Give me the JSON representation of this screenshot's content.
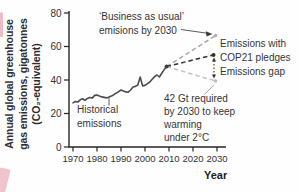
{
  "page": {
    "background": "#ffffff",
    "text_color": "#353535"
  },
  "labels": {
    "y_axis_title": "Annual global greenhouse\ngas emissions, gigatonnes\n(CO₂-equivalent)",
    "x_axis_title": "Year",
    "historical": "Historical\nemissions",
    "business_as_usual": "‘Business as usual’\nemisions by 2030",
    "cop21": "Emissions with\nCOP21 pledges",
    "emissions_gap": "Emissions gap",
    "required": "42 Gt required\nby 2030 to keep\nwarming\nunder 2°C"
  },
  "chart_data": {
    "type": "line",
    "title": "",
    "xlabel": "Year",
    "ylabel": "Annual global greenhouse gas emissions, gigatonnes (CO₂-equivalent)",
    "xlim": [
      1970,
      2033
    ],
    "ylim": [
      0,
      80
    ],
    "x_ticks": [
      1970,
      1980,
      1990,
      2000,
      2010,
      2020,
      2030
    ],
    "y_ticks": [
      0,
      20,
      40,
      60,
      80
    ],
    "grid": false,
    "legend_position": "none",
    "series": [
      {
        "name": "Historical emissions",
        "style": "solid",
        "color": "#4d4d4d",
        "x": [
          1970,
          1971,
          1972,
          1973,
          1974,
          1975,
          1976,
          1977,
          1978,
          1979,
          1980,
          1981,
          1982,
          1983,
          1984,
          1985,
          1986,
          1987,
          1988,
          1989,
          1990,
          1991,
          1992,
          1993,
          1994,
          1995,
          1996,
          1997,
          1998,
          1999,
          2000,
          2001,
          2002,
          2003,
          2004,
          2005,
          2006,
          2007,
          2008,
          2009
        ],
        "y": [
          26.3,
          27.2,
          26.8,
          28.2,
          28.8,
          27.9,
          29.0,
          29.6,
          29.2,
          30.8,
          31.0,
          30.4,
          29.9,
          29.6,
          29.3,
          29.8,
          30.4,
          31.2,
          32.2,
          33.0,
          34.0,
          33.5,
          32.9,
          32.7,
          34.0,
          35.8,
          36.2,
          37.0,
          41.8,
          36.5,
          36.8,
          37.8,
          38.8,
          40.5,
          42.0,
          43.0,
          41.8,
          44.0,
          46.2,
          48.0
        ]
      },
      {
        "name": "‘Business as usual’ emisions by 2030",
        "style": "dashed",
        "color": "#a8a8a8",
        "x": [
          2009,
          2030
        ],
        "y": [
          48,
          66.5
        ]
      },
      {
        "name": "Emissions with COP21 pledges",
        "style": "dashed",
        "color": "#333333",
        "x": [
          2009,
          2030
        ],
        "y": [
          48,
          55
        ]
      },
      {
        "name": "42 Gt required by 2030 to keep warming under 2°C",
        "style": "dashed",
        "color": "#c4c4c4",
        "x": [
          2009,
          2030
        ],
        "y": [
          48,
          42
        ]
      }
    ],
    "annotations": [
      {
        "text": "‘Business as usual’ emisions by 2030",
        "points_to_x": 2030,
        "points_to_y": 66.5
      },
      {
        "text": "Emissions with COP21 pledges",
        "points_to_x": 2030,
        "points_to_y": 55
      },
      {
        "text": "Emissions gap",
        "meaning": "gap between COP21 pledges and 42 Gt pathway at 2030"
      },
      {
        "text": "42 Gt required by 2030 to keep warming under 2°C",
        "points_to_x": 2030,
        "points_to_y": 42
      },
      {
        "text": "Historical emissions",
        "points_to_x": 1985,
        "points_to_y": 29.8
      }
    ]
  }
}
